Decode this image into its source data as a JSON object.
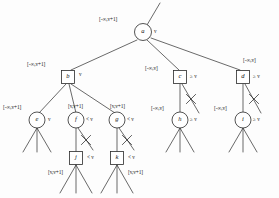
{
  "diagram": {
    "stroke_color": "#2a2a2a",
    "node_fill": "#ffffff",
    "text_color": "#1a1a1a",
    "symbols": {
      "neg_inf_v_plus_1": "[-∞,v+1]",
      "neg_inf_v": "[-∞,v]",
      "v_v_plus_1": "[v,v+1]",
      "eq_v": "v",
      "ge_v": "≥ v",
      "lt_v": "< v"
    },
    "nodes": [
      {
        "id": "a",
        "label": "a",
        "shape": "circle",
        "x": 143,
        "y": 32,
        "r": 8.5,
        "interval": "[-∞,v+1]",
        "interval_x": 99,
        "interval_y": 17,
        "op": "v",
        "op_x": 154,
        "op_y": 29
      },
      {
        "id": "b",
        "label": "b",
        "shape": "square",
        "x": 68,
        "y": 77,
        "size": 13,
        "interval": "[-∞,v+1]",
        "interval_x": 27,
        "interval_y": 62,
        "op": "v",
        "op_x": 79,
        "op_y": 72
      },
      {
        "id": "c",
        "label": "c",
        "shape": "square",
        "x": 180,
        "y": 77,
        "size": 13,
        "interval": "[-∞,v]",
        "interval_x": 145,
        "interval_y": 66,
        "op": "≥ v",
        "op_x": 190,
        "op_y": 74
      },
      {
        "id": "d",
        "label": "d",
        "shape": "square",
        "x": 243,
        "y": 77,
        "size": 13,
        "interval": "[-∞,v]",
        "interval_x": 243,
        "interval_y": 58,
        "op": "≥ v",
        "op_x": 253,
        "op_y": 74
      },
      {
        "id": "e",
        "label": "e",
        "shape": "circle",
        "x": 37,
        "y": 120,
        "r": 8,
        "interval": "[-∞,v+1]",
        "interval_x": 3,
        "interval_y": 105,
        "op": "v",
        "op_x": 48,
        "op_y": 117
      },
      {
        "id": "f",
        "label": "f",
        "shape": "circle",
        "x": 76,
        "y": 120,
        "r": 8,
        "interval": "[v,v+1]",
        "interval_x": 68,
        "interval_y": 104,
        "op": "< v",
        "op_x": 86,
        "op_y": 117
      },
      {
        "id": "g",
        "label": "g",
        "shape": "circle",
        "x": 117,
        "y": 120,
        "r": 8,
        "interval": "[v,v+1]",
        "interval_x": 110,
        "interval_y": 104,
        "op": "< v",
        "op_x": 127,
        "op_y": 117
      },
      {
        "id": "h",
        "label": "h",
        "shape": "circle",
        "x": 180,
        "y": 120,
        "r": 8,
        "interval": "[-∞,v]",
        "interval_x": 151,
        "interval_y": 106,
        "op": "≥ v",
        "op_x": 190,
        "op_y": 117
      },
      {
        "id": "i",
        "label": "i",
        "shape": "circle",
        "x": 243,
        "y": 120,
        "r": 8,
        "interval": "[-∞,v]",
        "interval_x": 214,
        "interval_y": 106,
        "op": "≥ v",
        "op_x": 253,
        "op_y": 117
      },
      {
        "id": "j",
        "label": "j",
        "shape": "square",
        "x": 76,
        "y": 158,
        "size": 13,
        "interval": "[v,v+1]",
        "interval_x": 48,
        "interval_y": 170,
        "op": "< v",
        "op_x": 87,
        "op_y": 155
      },
      {
        "id": "k",
        "label": "k",
        "shape": "square",
        "x": 117,
        "y": 158,
        "size": 13,
        "interval": "[v,v+1]",
        "interval_x": 128,
        "interval_y": 170,
        "op": "< v",
        "op_x": 128,
        "op_y": 155
      }
    ],
    "edges": [
      {
        "from": "root-stem",
        "x1": 160,
        "y1": 3,
        "x2": 147,
        "y2": 25,
        "pruned": false
      },
      {
        "from": "a",
        "to": "b",
        "x1": 137,
        "y1": 40,
        "x2": 71,
        "y2": 70,
        "pruned": false
      },
      {
        "from": "a",
        "to": "c",
        "x1": 147,
        "y1": 40,
        "x2": 179,
        "y2": 70,
        "pruned": false
      },
      {
        "from": "a",
        "to": "d",
        "x1": 151,
        "y1": 38,
        "x2": 240,
        "y2": 70,
        "pruned": false
      },
      {
        "from": "b",
        "to": "e",
        "x1": 66,
        "y1": 84,
        "x2": 39,
        "y2": 113,
        "pruned": false
      },
      {
        "from": "b",
        "to": "f",
        "x1": 69,
        "y1": 84,
        "x2": 76,
        "y2": 113,
        "pruned": false
      },
      {
        "from": "b",
        "to": "g",
        "x1": 71,
        "y1": 84,
        "x2": 115,
        "y2": 113,
        "pruned": false
      },
      {
        "from": "c",
        "to": "h",
        "x1": 180,
        "y1": 84,
        "x2": 180,
        "y2": 113,
        "pruned": false
      },
      {
        "from": "c",
        "to": "cut",
        "x1": 182,
        "y1": 84,
        "x2": 199,
        "y2": 113,
        "pruned": true,
        "cut_x": 191,
        "cut_y": 99
      },
      {
        "from": "d",
        "to": "i",
        "x1": 243,
        "y1": 84,
        "x2": 243,
        "y2": 113,
        "pruned": false
      },
      {
        "from": "d",
        "to": "cut",
        "x1": 245,
        "y1": 84,
        "x2": 261,
        "y2": 113,
        "pruned": true,
        "cut_x": 254,
        "cut_y": 99
      },
      {
        "from": "f",
        "to": "j",
        "x1": 76,
        "y1": 128,
        "x2": 76,
        "y2": 152,
        "pruned": false
      },
      {
        "from": "f",
        "to": "cut",
        "x1": 78,
        "y1": 128,
        "x2": 93,
        "y2": 150,
        "pruned": true,
        "cut_x": 86,
        "cut_y": 140
      },
      {
        "from": "g",
        "to": "k",
        "x1": 117,
        "y1": 128,
        "x2": 117,
        "y2": 152,
        "pruned": false
      },
      {
        "from": "g",
        "to": "cut",
        "x1": 119,
        "y1": 128,
        "x2": 134,
        "y2": 150,
        "pruned": true,
        "cut_x": 127,
        "cut_y": 140
      }
    ],
    "leaf_fans": [
      {
        "parent": "e",
        "x": 37,
        "y": 128,
        "spread": 14,
        "height": 24
      },
      {
        "parent": "h",
        "x": 180,
        "y": 128,
        "spread": 14,
        "height": 24
      },
      {
        "parent": "i",
        "x": 243,
        "y": 128,
        "spread": 14,
        "height": 24
      },
      {
        "parent": "j",
        "x": 76,
        "y": 165,
        "spread": 16,
        "height": 28
      },
      {
        "parent": "k",
        "x": 117,
        "y": 165,
        "spread": 16,
        "height": 28
      }
    ]
  }
}
